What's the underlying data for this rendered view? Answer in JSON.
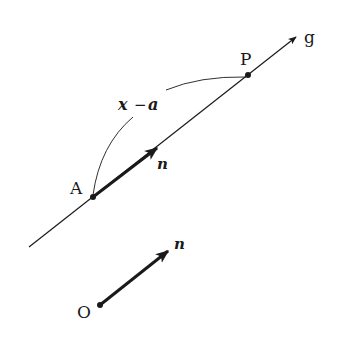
{
  "diagram": {
    "line": {
      "label": "g",
      "start": [
        29,
        247
      ],
      "end": [
        296,
        37
      ]
    },
    "points": [
      {
        "name": "A",
        "x": 93,
        "y": 197
      },
      {
        "name": "P",
        "x": 248,
        "y": 75
      },
      {
        "name": "O",
        "x": 100,
        "y": 305
      }
    ],
    "vectors": [
      {
        "label": "n",
        "from": "A",
        "to": [
          157,
          148
        ]
      },
      {
        "label": "n",
        "from": "O",
        "to": [
          168,
          251
        ]
      }
    ],
    "arc_label": {
      "var": "x",
      "op": "−",
      "const": "a"
    },
    "labels": {
      "g": "g",
      "A": "A",
      "P": "P",
      "O": "O",
      "n_on_line": "n",
      "n_free": "n",
      "x": "x",
      "minus": "−",
      "a": "a"
    },
    "colors": {
      "ink": "#1a1a1a",
      "background": "#ffffff"
    }
  }
}
